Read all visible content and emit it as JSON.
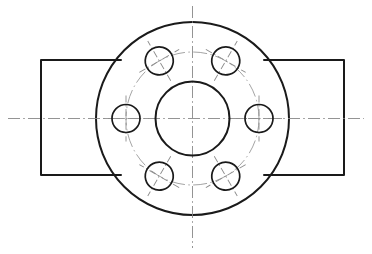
{
  "drawing": {
    "title": "Flange Front View",
    "type": "engineering-drawing",
    "view": "front",
    "units": "px",
    "canvas": {
      "width": 372,
      "height": 254
    },
    "background_color": "#ffffff",
    "line_color": "#1a1a1a",
    "centerline_color": "#8d8d8d",
    "center": {
      "x": 192.5,
      "y": 118.5
    },
    "outer_circle": {
      "name": "flange-outer-diameter",
      "cx": 192.5,
      "cy": 118.5,
      "r": 96.5,
      "stroke_width": 2
    },
    "center_bore": {
      "name": "center-bore",
      "cx": 192.5,
      "cy": 118.5,
      "r": 37,
      "stroke_width": 2
    },
    "bolt_circle": {
      "name": "bolt-circle",
      "cx": 192.5,
      "cy": 118.5,
      "r": 66.5,
      "line_style": "dash-dot",
      "stroke_width": 0.9
    },
    "bolt_holes": {
      "count": 6,
      "radius": 14,
      "start_angle_deg": 0,
      "angle_step_deg": 60,
      "items": [
        {
          "label": "bolt-hole-right",
          "angle_deg": 0,
          "cx": 259,
          "cy": 118.5
        },
        {
          "label": "bolt-hole-upper-right",
          "angle_deg": 60,
          "cx": 225.75,
          "cy": 61,
          "rot": -30
        },
        {
          "label": "bolt-hole-upper-left",
          "angle_deg": 120,
          "cx": 159.25,
          "cy": 61,
          "rot": 30
        },
        {
          "label": "bolt-hole-left",
          "angle_deg": 180,
          "cx": 126,
          "cy": 118.5
        },
        {
          "label": "bolt-hole-lower-left",
          "angle_deg": 240,
          "cx": 159.25,
          "cy": 176,
          "rot": -30
        },
        {
          "label": "bolt-hole-lower-right",
          "angle_deg": 300,
          "cx": 225.75,
          "cy": 176,
          "rot": 30
        }
      ]
    },
    "left_tab": {
      "name": "left-mounting-tab",
      "x": 41,
      "y": 60,
      "width": 80,
      "height": 115
    },
    "right_tab": {
      "name": "right-mounting-tab",
      "x": 264,
      "y": 60,
      "width": 80,
      "height": 115
    },
    "horizontal_centerline": {
      "name": "horizontal-centerline",
      "x1": 8,
      "x2": 364,
      "y": 118.5
    },
    "vertical_centerline": {
      "name": "vertical-centerline",
      "y1": 6,
      "y2": 248,
      "x": 192.5
    }
  }
}
